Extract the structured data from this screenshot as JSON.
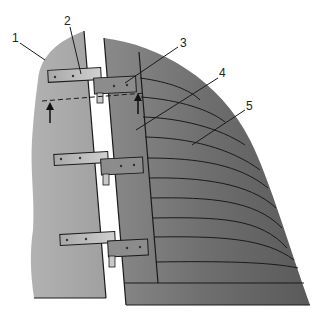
{
  "diagram": {
    "labels": [
      {
        "id": "1",
        "text": "1"
      },
      {
        "id": "2",
        "text": "2"
      },
      {
        "id": "3",
        "text": "3"
      },
      {
        "id": "4",
        "text": "4"
      },
      {
        "id": "5",
        "text": "5"
      }
    ],
    "colors": {
      "left_panel": "#a9a9a9",
      "right_panel": "#7a7a7a",
      "hinge_plate": "#b0b0b0",
      "hinge_plate_dark": "#8a8a8a",
      "line": "#1a1a1a"
    }
  }
}
